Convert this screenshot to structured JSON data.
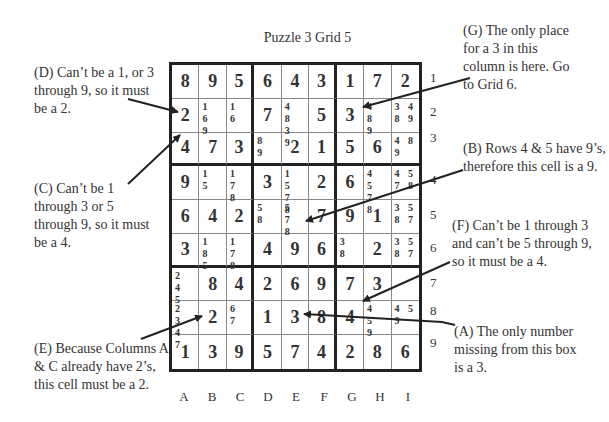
{
  "title": "Puzzle 3   Grid 5",
  "columns": [
    "A",
    "B",
    "C",
    "D",
    "E",
    "F",
    "G",
    "H",
    "I"
  ],
  "rows": [
    "1",
    "2",
    "3",
    "4",
    "5",
    "6",
    "7",
    "8",
    "9"
  ],
  "grid": [
    [
      {
        "v": "8"
      },
      {
        "v": "9"
      },
      {
        "v": "5"
      },
      {
        "v": "6"
      },
      {
        "v": "4"
      },
      {
        "v": "3"
      },
      {
        "v": "1"
      },
      {
        "v": "7"
      },
      {
        "v": "2"
      }
    ],
    [
      {
        "v": "2"
      },
      {
        "c": "1 6 9"
      },
      {
        "c": "1 6"
      },
      {
        "v": "7"
      },
      {
        "c": "4 8 3 9"
      },
      {
        "v": "5"
      },
      {
        "v": "3"
      },
      {
        "c": "4 8 9"
      },
      {
        "c": "3 4 8 9"
      }
    ],
    [
      {
        "v": "4"
      },
      {
        "v": "7"
      },
      {
        "v": "3"
      },
      {
        "c": "8 9"
      },
      {
        "v": "2"
      },
      {
        "v": "1"
      },
      {
        "v": "5"
      },
      {
        "v": "6"
      },
      {
        "c": "4 8 9"
      }
    ],
    [
      {
        "v": "9"
      },
      {
        "c": "1 5"
      },
      {
        "c": "1 7 8"
      },
      {
        "v": "3"
      },
      {
        "c": "1 5 7 8"
      },
      {
        "v": "2"
      },
      {
        "v": "6"
      },
      {
        "c": "4 5 7 8"
      },
      {
        "c": "4 5 7 8"
      }
    ],
    [
      {
        "v": "6"
      },
      {
        "v": "4"
      },
      {
        "v": "2"
      },
      {
        "c": "5 8"
      },
      {
        "c": "5 7 8"
      },
      {
        "v": "7"
      },
      {
        "v": "9"
      },
      {
        "v": "1"
      },
      {
        "c": "3 5 8 7"
      }
    ],
    [
      {
        "v": "3"
      },
      {
        "c": "1 8 5"
      },
      {
        "c": "1 7 8"
      },
      {
        "v": "4"
      },
      {
        "v": "9"
      },
      {
        "v": "6"
      },
      {
        "c": "3 8"
      },
      {
        "v": "2"
      },
      {
        "c": "3 5 8 7"
      }
    ],
    [
      {
        "c": "2 4 5"
      },
      {
        "v": "8"
      },
      {
        "v": "4"
      },
      {
        "v": "2"
      },
      {
        "v": "6"
      },
      {
        "v": "9"
      },
      {
        "v": "7"
      },
      {
        "v": "3"
      },
      {
        "c": ""
      }
    ],
    [
      {
        "c": "2 3 4 7"
      },
      {
        "v": "2"
      },
      {
        "c": "6 7"
      },
      {
        "v": "1"
      },
      {
        "v": "3"
      },
      {
        "v": "8"
      },
      {
        "v": "4"
      },
      {
        "c": "4 5 9"
      },
      {
        "c": "4 5 9"
      }
    ],
    [
      {
        "v": "1"
      },
      {
        "v": "3"
      },
      {
        "v": "9"
      },
      {
        "v": "5"
      },
      {
        "v": "7"
      },
      {
        "v": "4"
      },
      {
        "v": "2"
      },
      {
        "v": "8"
      },
      {
        "v": "6"
      }
    ]
  ],
  "notes": {
    "D": "(D) Can’t be a 1, or 3 through 9, so it must be a 2.",
    "C": "(C) Can’t be 1 through 3 or 5 through 9, so it must be a 4.",
    "E": "(E) Because Columns A & C already have 2’s, this cell must be a 2.",
    "G": "(G) The only place for a 3 in this column is here. Go to Grid 6.",
    "B": "(B) Rows 4 & 5 have 9’s, therefore this cell is a 9.",
    "F": "(F) Can’t be 1 through 3 and can’t be 5 through 9, so it must be a 4.",
    "A": "(A) The only number missing from this box is a 3."
  }
}
